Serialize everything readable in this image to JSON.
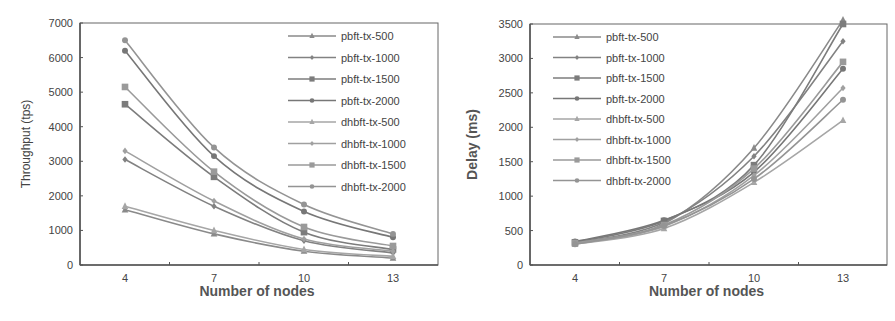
{
  "chart_data": [
    {
      "type": "line",
      "title": "",
      "xlabel": "Number of nodes",
      "ylabel": "Throughput  (tps)",
      "x": [
        4,
        7,
        10,
        13
      ],
      "x_tick_labels": [
        "4",
        "7",
        "10",
        "13"
      ],
      "ylim": [
        0,
        7000
      ],
      "y_ticks": [
        0,
        1000,
        2000,
        3000,
        4000,
        5000,
        6000,
        7000
      ],
      "grid": false,
      "legend_position": "upper right (inside)",
      "series": [
        {
          "name": "pbft-tx-500",
          "marker": "triangle",
          "color": "#8a8a8a",
          "values": [
            1600,
            900,
            400,
            200
          ]
        },
        {
          "name": "pbft-tx-1000",
          "marker": "diamond",
          "color": "#828282",
          "values": [
            3050,
            1700,
            700,
            350
          ]
        },
        {
          "name": "pbft-tx-1500",
          "marker": "square",
          "color": "#7c7c7c",
          "values": [
            4650,
            2550,
            950,
            450
          ]
        },
        {
          "name": "pbft-tx-2000",
          "marker": "circle",
          "color": "#777777",
          "values": [
            6200,
            3150,
            1550,
            800
          ]
        },
        {
          "name": "dhbft-tx-500",
          "marker": "triangle",
          "color": "#a6a6a6",
          "values": [
            1700,
            1000,
            450,
            250
          ]
        },
        {
          "name": "dhbft-tx-1000",
          "marker": "diamond",
          "color": "#a0a0a0",
          "values": [
            3300,
            1850,
            750,
            400
          ]
        },
        {
          "name": "dhbft-tx-1500",
          "marker": "square",
          "color": "#9a9a9a",
          "values": [
            5150,
            2700,
            1100,
            550
          ]
        },
        {
          "name": "dhbft-tx-2000",
          "marker": "circle",
          "color": "#949494",
          "values": [
            6500,
            3400,
            1750,
            900
          ]
        }
      ]
    },
    {
      "type": "line",
      "title": "",
      "xlabel": "Number of nodes",
      "ylabel": "Delay (ms)",
      "x": [
        4,
        7,
        10,
        13
      ],
      "x_tick_labels": [
        "4",
        "7",
        "10",
        "13"
      ],
      "ylim": [
        0,
        3500
      ],
      "y_ticks": [
        0,
        500,
        1000,
        1500,
        2000,
        2500,
        3000,
        3500
      ],
      "grid": false,
      "legend_position": "upper left (inside)",
      "series": [
        {
          "name": "pbft-tx-500",
          "marker": "triangle",
          "color": "#8a8a8a",
          "values": [
            310,
            600,
            1700,
            3560
          ]
        },
        {
          "name": "pbft-tx-1000",
          "marker": "diamond",
          "color": "#828282",
          "values": [
            320,
            620,
            1580,
            3250
          ]
        },
        {
          "name": "pbft-tx-1500",
          "marker": "square",
          "color": "#7c7c7c",
          "values": [
            330,
            640,
            1450,
            3500
          ]
        },
        {
          "name": "pbft-tx-2000",
          "marker": "circle",
          "color": "#777777",
          "values": [
            340,
            650,
            1350,
            2850
          ]
        },
        {
          "name": "dhbft-tx-500",
          "marker": "triangle",
          "color": "#a6a6a6",
          "values": [
            300,
            530,
            1200,
            2100
          ]
        },
        {
          "name": "dhbft-tx-1000",
          "marker": "diamond",
          "color": "#a0a0a0",
          "values": [
            310,
            560,
            1300,
            2570
          ]
        },
        {
          "name": "dhbft-tx-1500",
          "marker": "square",
          "color": "#9a9a9a",
          "values": [
            320,
            580,
            1400,
            2950
          ]
        },
        {
          "name": "dhbft-tx-2000",
          "marker": "circle",
          "color": "#949494",
          "values": [
            300,
            570,
            1250,
            2400
          ]
        }
      ]
    }
  ],
  "layout": {
    "left": {
      "plot": {
        "x0": 80,
        "y0": 23,
        "x1": 438,
        "y1": 265
      },
      "xpos": {
        "4": 125,
        "7": 214,
        "10": 304,
        "13": 393
      },
      "legend": {
        "x": 288,
        "y": 36,
        "dy": 21.5
      }
    },
    "right": {
      "plot": {
        "x0": 80,
        "y0": 24,
        "x1": 437,
        "y1": 265
      },
      "xpos": {
        "4": 125,
        "7": 214,
        "10": 304,
        "13": 393
      },
      "legend": {
        "x": 103,
        "y": 37,
        "dy": 20.5
      }
    },
    "axis_color": "#555555"
  }
}
